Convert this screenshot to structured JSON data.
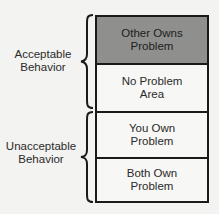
{
  "diagram": {
    "cells": [
      {
        "line1": "Other Owns",
        "line2": "Problem",
        "shaded": true
      },
      {
        "line1": "No Problem",
        "line2": "Area",
        "shaded": false
      },
      {
        "line1": "You Own",
        "line2": "Problem",
        "shaded": false
      },
      {
        "line1": "Both Own",
        "line2": "Problem",
        "shaded": false
      }
    ],
    "groups": [
      {
        "line1": "Acceptable",
        "line2": "Behavior",
        "spans_cells": [
          0,
          1
        ],
        "brace_icon": "curly-brace"
      },
      {
        "line1": "Unacceptable",
        "line2": "Behavior",
        "spans_cells": [
          2,
          3
        ],
        "brace_icon": "curly-brace"
      }
    ],
    "colors": {
      "shaded_cell": "#8f8f8d",
      "border": "#1a1a1a",
      "background": "#f3f3f1"
    }
  }
}
